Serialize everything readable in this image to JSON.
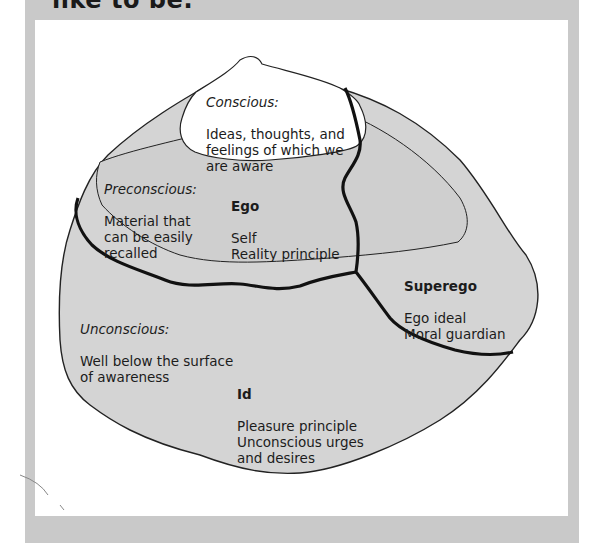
{
  "title": "like to be:",
  "colors": {
    "frame": "#c9c9c9",
    "panel": "#ffffff",
    "region_fill": "#d4d4d4",
    "conscious_fill": "#ffffff",
    "outline": "#222222",
    "text": "#1c1c1c"
  },
  "diagram": {
    "conscious": {
      "heading": "Conscious:",
      "text": "Ideas, thoughts, and\nfeelings of which we\nare aware"
    },
    "preconscious": {
      "heading": "Preconscious:",
      "text": "Material that\ncan be easily\nrecalled"
    },
    "ego": {
      "heading": "Ego",
      "text": "Self\nReality principle"
    },
    "superego": {
      "heading": "Superego",
      "text": "Ego ideal\nMoral guardian"
    },
    "unconscious": {
      "heading": "Unconscious:",
      "text": "Well below the surface\nof awareness"
    },
    "id": {
      "heading": "Id",
      "text": "Pleasure principle\nUnconscious urges\nand desires"
    }
  }
}
